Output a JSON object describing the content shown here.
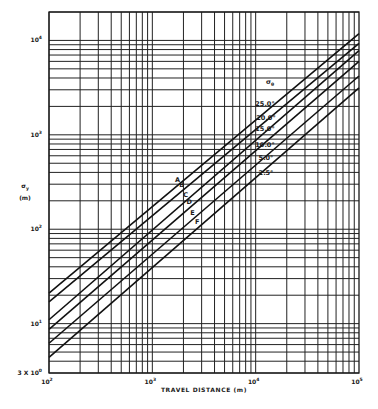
{
  "chart_data": {
    "type": "line",
    "title": "",
    "xlabel": "TRAVEL DISTANCE (m)",
    "ylabel": "σy (m)",
    "ylabel_symbol": "σ",
    "ylabel_subscript": "y",
    "ylabel_units": "(m)",
    "xscale": "log",
    "yscale": "log",
    "xlim": [
      100,
      100000
    ],
    "ylim": [
      3,
      20000
    ],
    "grid": true,
    "x_ticks": [
      {
        "value": 100,
        "label": "10",
        "exp": "2"
      },
      {
        "value": 1000,
        "label": "10",
        "exp": "3"
      },
      {
        "value": 10000,
        "label": "10",
        "exp": "4"
      },
      {
        "value": 100000,
        "label": "10",
        "exp": "5"
      }
    ],
    "y_ticks": [
      {
        "value": 3,
        "label": "3 X 10",
        "exp": "0"
      },
      {
        "value": 10,
        "label": "10",
        "exp": "1"
      },
      {
        "value": 100,
        "label": "10",
        "exp": "2"
      },
      {
        "value": 1000,
        "label": "10",
        "exp": "3"
      },
      {
        "value": 10000,
        "label": "10",
        "exp": "4"
      }
    ],
    "legend": {
      "placement": "upper-middle-right",
      "title_symbol": "σ",
      "title_subscript": "θ",
      "entries": [
        "25.0°",
        "20.0°",
        "15.0°",
        "10.0°",
        "5.0°",
        "2.5°"
      ]
    },
    "series": [
      {
        "name": "A",
        "theta": "25.0°",
        "x": [
          100,
          100000
        ],
        "y": [
          21,
          11800
        ]
      },
      {
        "name": "B",
        "theta": "20.0°",
        "x": [
          100,
          100000
        ],
        "y": [
          17,
          9300
        ]
      },
      {
        "name": "C",
        "theta": "15.0°",
        "x": [
          100,
          100000
        ],
        "y": [
          11,
          7800
        ]
      },
      {
        "name": "D",
        "theta": "10.0°",
        "x": [
          100,
          100000
        ],
        "y": [
          8.7,
          6000
        ]
      },
      {
        "name": "E",
        "theta": "5.0°",
        "x": [
          100,
          100000
        ],
        "y": [
          6.2,
          4200
        ]
      },
      {
        "name": "F",
        "theta": "2.5°",
        "x": [
          100,
          100000
        ],
        "y": [
          4.4,
          3150
        ]
      }
    ],
    "curve_label_x": [
      2000,
      2200,
      2400,
      2600,
      2800,
      3100
    ]
  }
}
